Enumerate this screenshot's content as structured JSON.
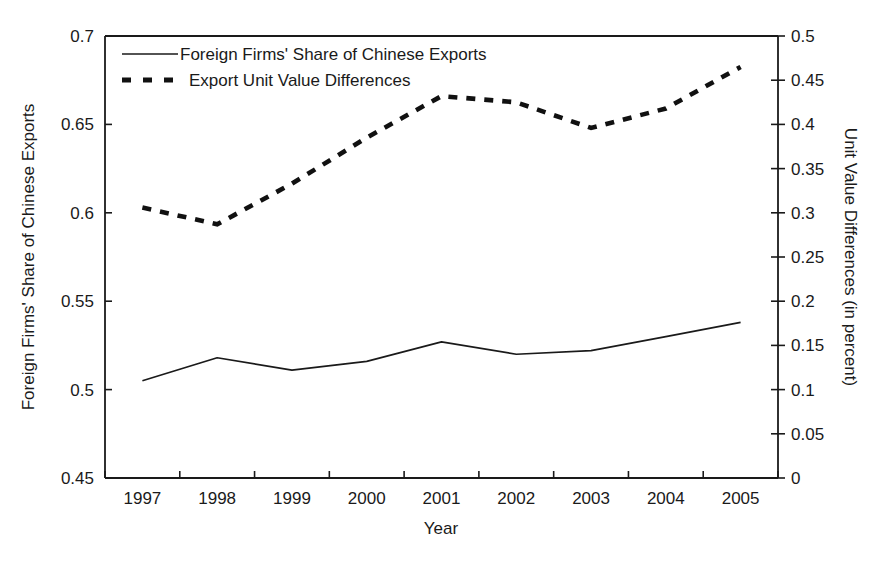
{
  "chart_data": {
    "type": "line",
    "title": "",
    "subtitle": "",
    "xlabel": "Year",
    "ylabel": "Foreign Firms' Share of Chinese Exports",
    "ylabel_right": "Unit Value Differences (in percent)",
    "grid": false,
    "legend_position": "top-left-inside",
    "x": [
      1997,
      1998,
      1999,
      2000,
      2001,
      2002,
      2003,
      2004,
      2005
    ],
    "categories": [
      "1997",
      "1998",
      "1999",
      "2000",
      "2001",
      "2002",
      "2003",
      "2004",
      "2005"
    ],
    "xlim": [
      1996.5,
      2005.5
    ],
    "ylim": [
      0.45,
      0.7
    ],
    "ylim_right": [
      0,
      0.5
    ],
    "yticks": [
      0.45,
      0.5,
      0.55,
      0.6,
      0.65,
      0.7
    ],
    "ytick_labels": [
      "0.45",
      "0.5",
      "0.55",
      "0.6",
      "0.65",
      "0.7"
    ],
    "yticks_right": [
      0,
      0.05,
      0.1,
      0.15,
      0.2,
      0.25,
      0.3,
      0.35,
      0.4,
      0.45,
      0.5
    ],
    "ytick_labels_right": [
      "0",
      "0.05",
      "0.1",
      "0.15",
      "0.2",
      "0.25",
      "0.3",
      "0.35",
      "0.4",
      "0.45",
      "0.5"
    ],
    "series": [
      {
        "name": "Foreign Firms' Share of Chinese Exports",
        "axis": "left",
        "style": "solid",
        "color": "#1a1a1a",
        "values": [
          0.505,
          0.518,
          0.511,
          0.516,
          0.527,
          0.52,
          0.522,
          0.53,
          0.538
        ]
      },
      {
        "name": "Export Unit Value Differences",
        "axis": "right",
        "style": "dashed",
        "color": "#111111",
        "values": [
          0.306,
          0.287,
          0.333,
          0.385,
          0.432,
          0.425,
          0.396,
          0.418,
          0.465
        ]
      }
    ]
  },
  "legend": {
    "entries": [
      {
        "label": "Foreign Firms' Share of Chinese Exports",
        "style": "solid"
      },
      {
        "label": "Export Unit Value Differences",
        "style": "dashed"
      }
    ]
  },
  "axes": {
    "x_title": "Year",
    "y_left_title": "Foreign Firms' Share of Chinese Exports",
    "y_right_title": "Unit Value Differences (in percent)"
  },
  "colors": {
    "ink": "#1a1a1a",
    "background": "#ffffff"
  }
}
